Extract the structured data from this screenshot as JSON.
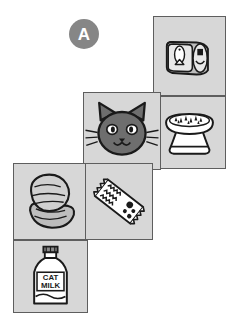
{
  "figure": {
    "type": "cube-net-diagram",
    "label": "A",
    "background_color": "#ffffff",
    "cell_fill": "#d7d7d7",
    "cell_border": "#5e5e5e",
    "ink_color": "#1a1a1a",
    "badge_color": "#868686",
    "badge_text_color": "#ffffff"
  },
  "badge": {
    "label": "A",
    "x": 69,
    "y": 19,
    "size": 30
  },
  "cells": [
    {
      "id": "cell-fish-can",
      "icon": "fish-can-icon",
      "caption": "",
      "x": 153,
      "y": 16,
      "width": 73,
      "height": 80,
      "column": "right",
      "row": 1
    },
    {
      "id": "cell-food-bowl",
      "icon": "food-bowl-icon",
      "caption": "",
      "x": 153,
      "y": 96,
      "width": 73,
      "height": 73,
      "column": "right",
      "row": 2
    },
    {
      "id": "cell-cat-face",
      "icon": "cat-face-icon",
      "caption": "",
      "x": 83,
      "y": 92,
      "width": 78,
      "height": 78,
      "column": "middle",
      "row": 2
    },
    {
      "id": "cell-meat-fillet",
      "icon": "meat-fillet-icon",
      "caption": "",
      "x": 13,
      "y": 163,
      "width": 75,
      "height": 77,
      "column": "left",
      "row": 3
    },
    {
      "id": "cell-treat-bag",
      "icon": "treat-bag-icon",
      "caption": "",
      "x": 85,
      "y": 163,
      "width": 68,
      "height": 77,
      "column": "middle",
      "row": 3
    },
    {
      "id": "cell-cat-milk",
      "icon": "cat-milk-bottle-icon",
      "caption": "CAT MILK",
      "caption_line1": "CAT",
      "caption_line2": "MILK",
      "x": 13,
      "y": 240,
      "width": 75,
      "height": 73,
      "column": "left",
      "row": 4
    }
  ]
}
